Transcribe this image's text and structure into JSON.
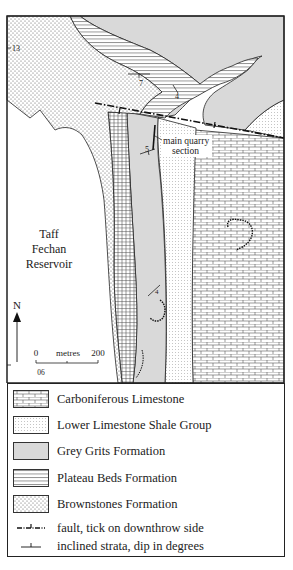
{
  "map": {
    "labels": {
      "reservoir_line1": "Taff",
      "reservoir_line2": "Fechan",
      "reservoir_line3": "Reservoir",
      "quarry_line1": "main quarry",
      "quarry_line2": "section",
      "north": "N",
      "grid_north": "13",
      "grid_east": "06"
    },
    "scale_bar": {
      "start": "0",
      "unit": "metres",
      "end": "200"
    },
    "dip_values": [
      "7",
      "4",
      "5",
      "4"
    ],
    "colors": {
      "grey_grits": "#d9d9d9",
      "outline": "#222222",
      "background": "#ffffff"
    }
  },
  "legend": {
    "items": [
      {
        "label": "Carboniferous Limestone",
        "pattern": "brick"
      },
      {
        "label": "Lower Limestone Shale Group",
        "pattern": "fine-dots"
      },
      {
        "label": "Grey Grits Formation",
        "pattern": "grey-fill"
      },
      {
        "label": "Plateau Beds Formation",
        "pattern": "horizontal-lines"
      },
      {
        "label": "Brownstones Formation",
        "pattern": "dense-dots"
      }
    ],
    "symbols": [
      {
        "label": "fault, tick on downthrow side",
        "symbol": "fault-line"
      },
      {
        "label": "inclined strata, dip in degrees",
        "symbol": "dip-symbol"
      }
    ]
  }
}
